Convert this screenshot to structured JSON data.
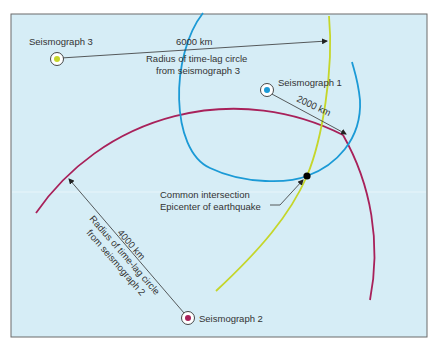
{
  "colors": {
    "background": "#d6edf6",
    "border": "#6b6b6b",
    "seismograph_1": "#1b9ad6",
    "seismograph_2": "#a8215a",
    "seismograph_3": "#c5d62a",
    "epicenter": "#000000",
    "line": "#333333"
  },
  "seismographs": [
    {
      "id": "1",
      "label": "Seismograph 1",
      "distance": "2000 km"
    },
    {
      "id": "2",
      "label": "Seismograph 2",
      "distance": "4000 km",
      "radius_label_1": "Radius of time-lag circle",
      "radius_label_2": "from seismograph 2"
    },
    {
      "id": "3",
      "label": "Seismograph 3",
      "distance": "6000 km",
      "radius_label_1": "Radius of time-lag circle",
      "radius_label_2": "from seismograph 3"
    }
  ],
  "epicenter": {
    "label_1": "Common intersection",
    "label_2": "Epicenter of earthquake"
  }
}
